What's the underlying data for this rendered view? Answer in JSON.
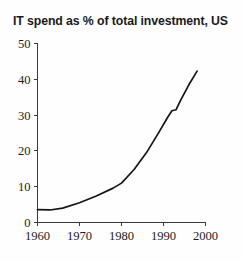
{
  "chart_data": {
    "type": "line",
    "title": "IT spend as % of total investment, US",
    "xlabel": "",
    "ylabel": "",
    "xlim": [
      1960,
      2000
    ],
    "ylim": [
      0,
      50
    ],
    "xticks": [
      1960,
      1970,
      1980,
      1990,
      2000
    ],
    "xtick_labels": [
      "1960",
      "1970",
      "1980",
      "1990",
      "2000"
    ],
    "yticks": [
      0,
      10,
      20,
      30,
      40,
      50
    ],
    "ytick_labels": [
      "0",
      "10",
      "20",
      "30",
      "40",
      "50"
    ],
    "grid": false,
    "legend": false,
    "line_color": "#151515",
    "axis_color": "#3a3a3a",
    "background_color": "#fefefe",
    "series": [
      {
        "name": "IT spend as % of total investment",
        "x": [
          1960,
          1963,
          1966,
          1970,
          1974,
          1978,
          1980,
          1983,
          1986,
          1989,
          1991,
          1992,
          1993,
          1994,
          1996,
          1998
        ],
        "values": [
          3.6,
          3.5,
          4.0,
          5.5,
          7.4,
          9.6,
          11.0,
          14.8,
          19.6,
          25.4,
          29.4,
          31.2,
          31.5,
          34.0,
          38.4,
          42.3
        ]
      }
    ]
  },
  "figure": {
    "title": "IT spend as % of total investment, US"
  }
}
